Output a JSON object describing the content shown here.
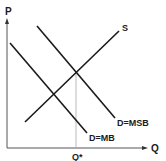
{
  "diagram": {
    "type": "supply-demand-externality",
    "axes": {
      "y_label": "P",
      "x_label": "Q",
      "equilibrium_label": "Q*"
    },
    "curves": [
      {
        "id": "supply",
        "label": "S"
      },
      {
        "id": "marginal-social-benefit",
        "label": "D=MSB"
      },
      {
        "id": "marginal-benefit",
        "label": "D=MB"
      }
    ],
    "colors": {
      "line": "#1a1a1a",
      "axis": "#555555",
      "guide": "#aaaaaa"
    }
  }
}
